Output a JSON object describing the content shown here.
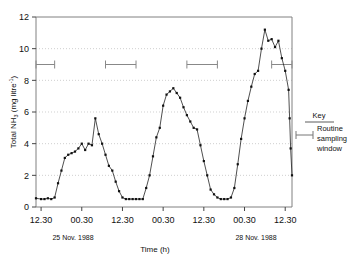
{
  "chart_data": {
    "type": "line",
    "title": "",
    "xlabel": "Time (h)",
    "ylabel": "Total NH3 (mg litre-1)",
    "ylabel_parts": {
      "prefix": "Total NH",
      "sub": "3",
      "mid": " (mg litre",
      "sup": "-1",
      "suffix": ")"
    },
    "ylim": [
      0,
      12
    ],
    "yticks": [
      0,
      2,
      4,
      6,
      8,
      10,
      12
    ],
    "ytick_labels": [
      "0",
      "2",
      "4",
      "6",
      "8",
      "10",
      "12"
    ],
    "gridlines_y": [
      2,
      4,
      6,
      8,
      10
    ],
    "grid": "dotted horizontal gridlines",
    "xtick_labels": [
      "12.30",
      "00.30",
      "12.30",
      "00.30",
      "12.30",
      "00.30",
      "12.30"
    ],
    "xtick_positions_h": [
      0,
      12,
      24,
      36,
      48,
      60,
      72
    ],
    "xlim_h": [
      -1.5,
      74
    ],
    "date_annotations": [
      {
        "text": "25 Nov. 1988",
        "at_h": 6
      },
      {
        "text": "28 Nov. 1988",
        "at_h": 60
      }
    ],
    "legend": {
      "position": "right-outside",
      "title": "Key",
      "entry": "Routine sampling window"
    },
    "sampling_windows": [
      {
        "start_h": -1.5,
        "end_h": 4.0,
        "y": 9.0
      },
      {
        "start_h": 19.0,
        "end_h": 28.0,
        "y": 9.0
      },
      {
        "start_h": 43.0,
        "end_h": 52.0,
        "y": 9.0
      },
      {
        "start_h": 68.0,
        "end_h": 74.0,
        "y": 9.0
      }
    ],
    "series": [
      {
        "name": "Total NH3",
        "marker": "filled-square",
        "line": "solid",
        "x": [
          -1.5,
          0.0,
          1.0,
          2.0,
          3.0,
          4.0,
          5.0,
          6.0,
          7.0,
          8.0,
          9.0,
          10.0,
          11.0,
          12.0,
          13.0,
          14.0,
          15.0,
          16.0,
          17.0,
          18.0,
          19.0,
          20.0,
          21.0,
          22.0,
          23.0,
          24.0,
          25.0,
          26.0,
          27.0,
          28.0,
          29.0,
          30.0,
          31.0,
          32.0,
          33.0,
          34.0,
          35.0,
          36.0,
          37.0,
          38.0,
          39.0,
          40.0,
          41.0,
          42.0,
          43.0,
          44.0,
          45.0,
          46.0,
          47.0,
          48.0,
          49.0,
          50.0,
          51.0,
          52.0,
          53.0,
          54.0,
          55.0,
          56.0,
          57.0,
          58.0,
          59.0,
          60.0,
          61.0,
          62.0,
          63.0,
          64.0,
          65.0,
          66.0,
          67.0,
          68.0,
          69.0,
          70.0,
          71.0,
          72.0,
          73.0
        ],
        "y": [
          0.55,
          0.5,
          0.5,
          0.55,
          0.5,
          0.6,
          1.5,
          2.3,
          3.1,
          3.3,
          3.4,
          3.5,
          3.7,
          4.0,
          3.6,
          4.0,
          3.9,
          5.6,
          4.6,
          4.0,
          3.3,
          2.6,
          2.3,
          1.6,
          1.0,
          0.6,
          0.5,
          0.5,
          0.5,
          0.5,
          0.5,
          0.5,
          1.2,
          2.0,
          3.2,
          4.4,
          5.0,
          6.4,
          7.1,
          7.3,
          7.5,
          7.2,
          6.9,
          6.3,
          5.8,
          5.4,
          5.0,
          4.9,
          3.9,
          2.9,
          2.0,
          1.1,
          0.8,
          0.6,
          0.5,
          0.5,
          0.5,
          0.6,
          1.2,
          2.7,
          4.3,
          5.6,
          6.7,
          7.6,
          8.4,
          8.6,
          10.0,
          11.2,
          10.5,
          10.6,
          10.1,
          10.5,
          9.4,
          8.6,
          7.4
        ]
      }
    ],
    "peaks": [
      5.6,
      7.5,
      11.2
    ],
    "troughs": [
      0.5,
      0.5,
      0.5
    ]
  },
  "tail_segment": {
    "x": [
      73.0,
      73.3,
      73.6,
      74.0
    ],
    "y": [
      7.4,
      5.6,
      3.7,
      2.0
    ],
    "last_point": 2.0
  }
}
